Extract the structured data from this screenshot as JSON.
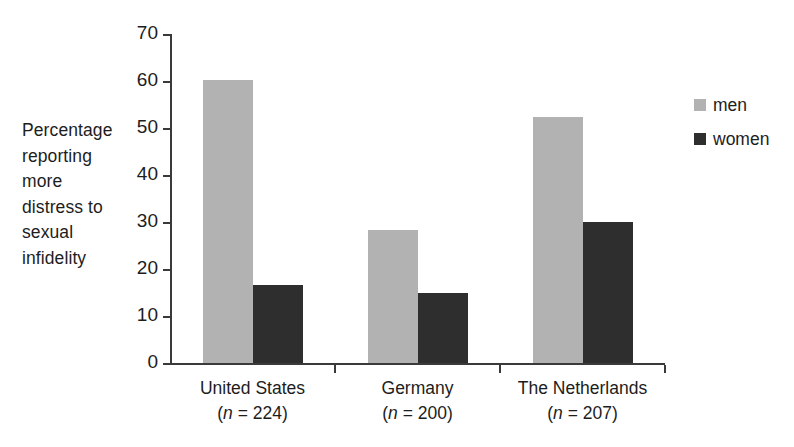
{
  "chart_data": {
    "type": "bar",
    "title": "",
    "subtitle": "",
    "xlabel": "",
    "ylabel": "Percentage reporting more distress to sexual infidelity",
    "ylabel_lines": [
      "Percentage",
      "reporting",
      "more",
      "distress to",
      "sexual",
      "infidelity"
    ],
    "categories": [
      "United States",
      "Germany",
      "The Netherlands"
    ],
    "category_sublabels": [
      "(n = 224)",
      "(n = 200)",
      "(n = 207)"
    ],
    "sample_sizes": [
      224,
      200,
      207
    ],
    "series": [
      {
        "name": "men",
        "values": [
          60.3,
          28.2,
          52.4
        ],
        "color": "#b2b2b2"
      },
      {
        "name": "women",
        "values": [
          16.7,
          15.0,
          30.1
        ],
        "color": "#2e2e2e"
      }
    ],
    "ylim": [
      0,
      70
    ],
    "yticks": [
      0,
      10,
      20,
      30,
      40,
      50,
      60,
      70
    ],
    "ytick_labels": [
      "0",
      "10",
      "20",
      "30",
      "40",
      "50",
      "60",
      "70"
    ],
    "grid": false,
    "legend_position": "right",
    "axis_color": "#3a3a3a",
    "background": "#ffffff"
  },
  "legend": {
    "items": [
      {
        "label": "men",
        "color": "#b2b2b2"
      },
      {
        "label": "women",
        "color": "#2e2e2e"
      }
    ]
  }
}
